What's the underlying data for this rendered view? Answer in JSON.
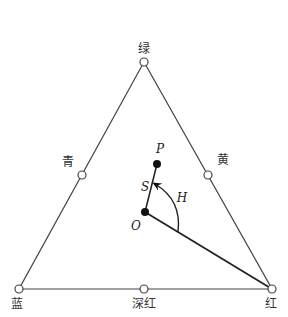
{
  "diagram": {
    "type": "HSI color triangle",
    "vertices": {
      "top": {
        "label": "绿"
      },
      "bottom_left": {
        "label": "蓝"
      },
      "bottom_right": {
        "label": "红"
      }
    },
    "midpoints": {
      "left": {
        "label": "青"
      },
      "right": {
        "label": "黄"
      },
      "bottom": {
        "label": "深红"
      }
    },
    "points": {
      "P": {
        "label": "P"
      },
      "O": {
        "label": "O"
      }
    },
    "annotations": {
      "saturation": "S",
      "hue": "H"
    },
    "colors": {
      "stroke": "#333333",
      "fill_open": "#ffffff",
      "fill_solid": "#111111"
    }
  }
}
